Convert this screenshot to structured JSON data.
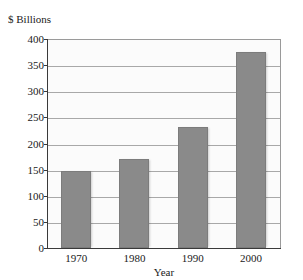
{
  "chart_data": {
    "type": "bar",
    "title": "",
    "subtitle": "",
    "categories": [
      "1970",
      "1980",
      "1990",
      "2000"
    ],
    "values": [
      147,
      170,
      232,
      375
    ],
    "xlabel": "Year",
    "ylabel": "$ Billions",
    "ylim": [
      0,
      400
    ],
    "ytick_labels": [
      "400",
      "350",
      "300",
      "250",
      "200",
      "150",
      "100",
      "50",
      "0"
    ],
    "ytick_values": [
      400,
      350,
      300,
      250,
      200,
      150,
      100,
      50,
      0
    ],
    "grid": true,
    "legend": "none",
    "series": [
      {
        "name": "",
        "values": [
          147,
          170,
          232,
          375
        ]
      }
    ],
    "bar_color": "#8a8a8a",
    "plot_background": "#fbfbfb",
    "gridline_color": "#a8a8a8",
    "axis_color": "#3a3a3a",
    "text_color": "#1a1a1a"
  },
  "labels": {
    "y_caption": "$ Billions",
    "x_axis_title": "Year",
    "title_remnant": ""
  }
}
